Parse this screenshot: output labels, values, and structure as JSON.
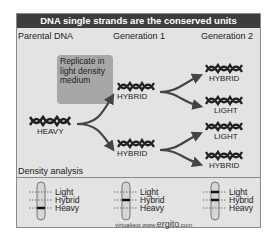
{
  "title": "DNA single strands are the conserved units",
  "columns": {
    "parental": "Parental DNA",
    "gen1": "Generation 1",
    "gen2": "Generation 2"
  },
  "process_box": "Replicate in light density medium",
  "molecules": {
    "parent": "HEAVY",
    "gen1_top": "HYBRID",
    "gen1_bottom": "HYBRID",
    "gen2": [
      "HYBRID",
      "LIGHT",
      "LIGHT",
      "HYBRID"
    ]
  },
  "density_analysis": {
    "title": "Density analysis",
    "tubes": [
      {
        "labels": [
          "Light",
          "Hybrid",
          "Heavy"
        ],
        "band": "Heavy"
      },
      {
        "labels": [
          "Light",
          "Hybrid",
          "Heavy"
        ],
        "band": "Hybrid"
      },
      {
        "labels": [
          "Light",
          "Hybrid",
          "Heavy"
        ],
        "band": "Light+Hybrid"
      }
    ]
  },
  "credit": {
    "prefix": "virtualtext  www.",
    "brand": "ergito",
    "suffix": ".com"
  },
  "colors": {
    "header_bg": "#3d3d3d",
    "panel_bg": "#e3e3e3",
    "box_bg": "#a7a7a7",
    "arrow": "#444444"
  }
}
